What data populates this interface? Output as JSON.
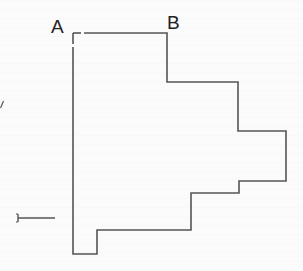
{
  "diagram": {
    "type": "stepped-outline-shape",
    "labels": {
      "a": "A",
      "b": "B"
    },
    "stroke_color": "#555555",
    "outline_points": [
      [
        73,
        33
      ],
      [
        167,
        33
      ],
      [
        167,
        82
      ],
      [
        238,
        82
      ],
      [
        238,
        131
      ],
      [
        286,
        131
      ],
      [
        286,
        181
      ],
      [
        239,
        181
      ],
      [
        239,
        193
      ],
      [
        191,
        193
      ],
      [
        191,
        230
      ],
      [
        97,
        230
      ],
      [
        97,
        254
      ],
      [
        73,
        254
      ]
    ],
    "marks": {
      "slash": "/",
      "bracket_line": "bracket-line-marker"
    }
  }
}
